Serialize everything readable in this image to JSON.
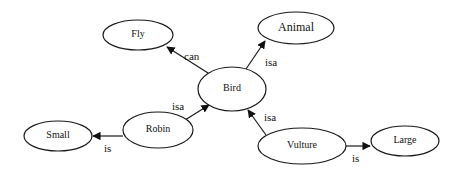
{
  "diagram": {
    "type": "semantic-network",
    "nodes": [
      {
        "id": "fly",
        "label": "Fly",
        "cx": 138,
        "cy": 35,
        "rx": 35,
        "ry": 15
      },
      {
        "id": "animal",
        "label": "Animal",
        "cx": 296,
        "cy": 28,
        "rx": 38,
        "ry": 16
      },
      {
        "id": "bird",
        "label": "Bird",
        "cx": 232,
        "cy": 89,
        "rx": 34,
        "ry": 22
      },
      {
        "id": "robin",
        "label": "Robin",
        "cx": 158,
        "cy": 130,
        "rx": 35,
        "ry": 18
      },
      {
        "id": "small",
        "label": "Small",
        "cx": 58,
        "cy": 136,
        "rx": 34,
        "ry": 15
      },
      {
        "id": "vulture",
        "label": "Vulture",
        "cx": 302,
        "cy": 146,
        "rx": 44,
        "ry": 18
      },
      {
        "id": "large",
        "label": "Large",
        "cx": 405,
        "cy": 141,
        "rx": 34,
        "ry": 15
      }
    ],
    "edges": [
      {
        "from": "bird",
        "to": "fly",
        "label": "can"
      },
      {
        "from": "bird",
        "to": "animal",
        "label": "isa"
      },
      {
        "from": "robin",
        "to": "bird",
        "label": "isa"
      },
      {
        "from": "robin",
        "to": "small",
        "label": "is"
      },
      {
        "from": "vulture",
        "to": "bird",
        "label": "isa"
      },
      {
        "from": "vulture",
        "to": "large",
        "label": "is"
      }
    ]
  }
}
